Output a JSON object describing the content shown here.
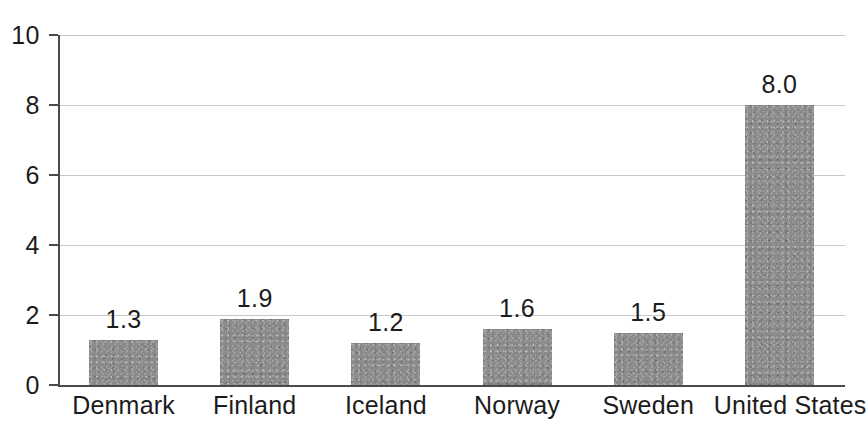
{
  "chart_data": {
    "type": "bar",
    "title": "",
    "subtitle": "",
    "xlabel": "",
    "ylabel": "",
    "categories": [
      "Denmark",
      "Finland",
      "Iceland",
      "Norway",
      "Sweden",
      "United States"
    ],
    "values": [
      1.3,
      1.9,
      1.2,
      1.6,
      1.5,
      8.0
    ],
    "value_labels": [
      "1.3",
      "1.9",
      "1.2",
      "1.6",
      "1.5",
      "8.0"
    ],
    "ylim": [
      0,
      10
    ],
    "ytick_labels": [
      "0",
      "2",
      "4",
      "6",
      "8",
      "10"
    ],
    "ytick_values": [
      0,
      2,
      4,
      6,
      8,
      10
    ],
    "grid": "horizontal",
    "legend": "none",
    "bar_color": "#8b8b8b",
    "axis_color": "#4a4a4a",
    "grid_color": "#c9c9c9",
    "text_color": "#1c1c1c",
    "background_color": "#ffffff"
  }
}
